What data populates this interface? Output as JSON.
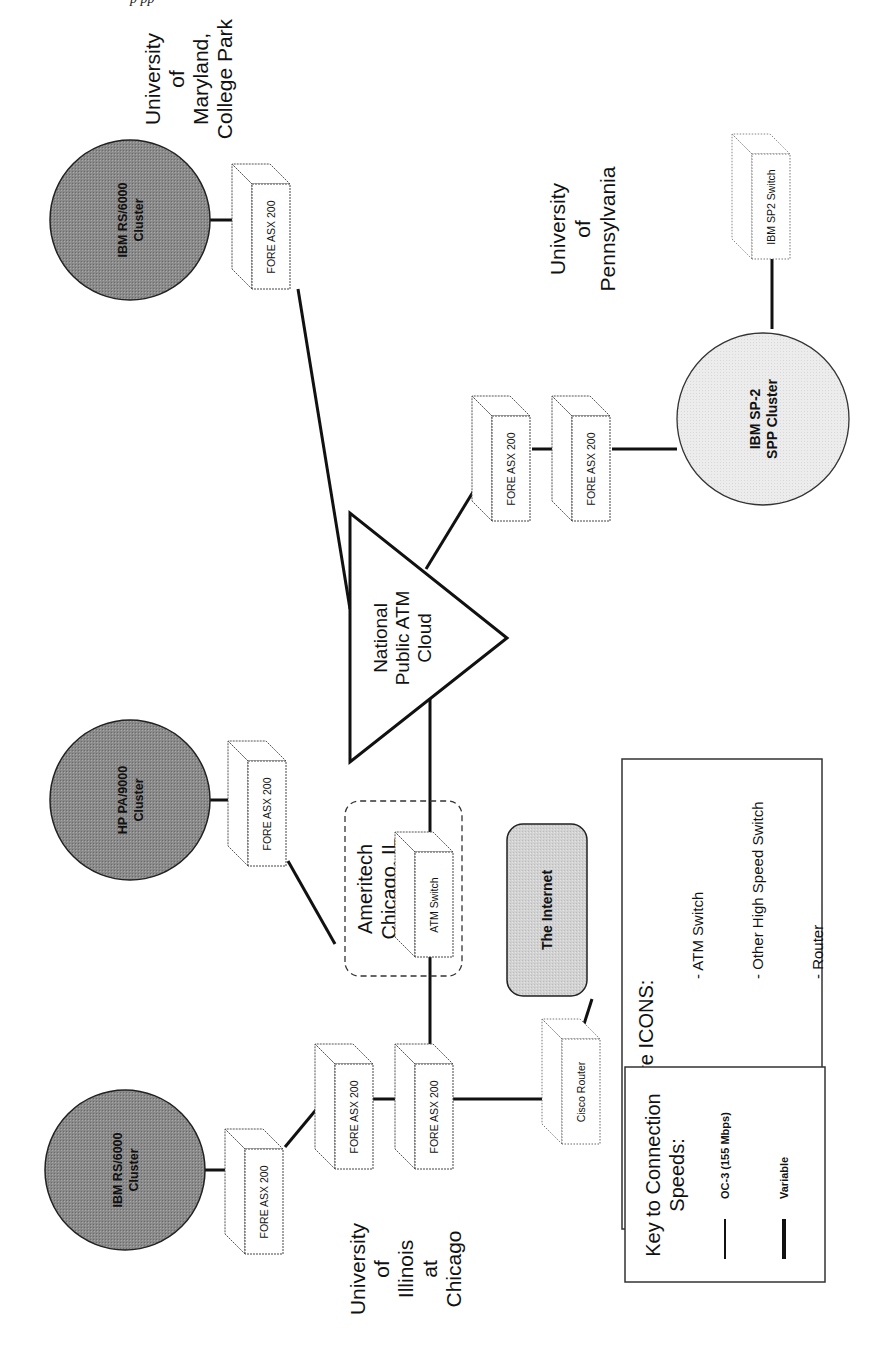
{
  "header": {
    "text_fragment": "p                      pp"
  },
  "sites": {
    "umd": [
      "University",
      "of",
      "Maryland,",
      "College Park"
    ],
    "upenn": [
      "University",
      "of",
      "Pennsylvania"
    ],
    "uic": [
      "University",
      "of",
      "Illinois",
      "at",
      "Chicago"
    ],
    "ameritech": [
      "Ameritech",
      "Chicago, IL"
    ]
  },
  "clusters": {
    "umd_cluster": [
      "IBM RS/6000",
      "Cluster"
    ],
    "hp_cluster": [
      "HP PA/9000",
      "Cluster"
    ],
    "uic_cluster": [
      "IBM RS/6000",
      "Cluster"
    ],
    "sp2_cluster": [
      "IBM SP-2",
      "SPP Cluster"
    ]
  },
  "cloud": [
    "National",
    "Public ATM",
    "Cloud"
  ],
  "internet": "The Internet",
  "devices": {
    "fore": "FORE ASX 200",
    "atm_switch": "ATM Switch",
    "cisco": "Cisco Router",
    "sp2_switch": "IBM SP2 Switch"
  },
  "hardware_key": {
    "title": "Key to Hardware ICONS:",
    "items": [
      {
        "label": "- ATM Switch",
        "color": "#2a2a2a"
      },
      {
        "label": "- Other High Speed Switch",
        "color": "#5a5a5a"
      },
      {
        "label": "- Router",
        "color": "#b8b8b8"
      }
    ]
  },
  "speed_key": {
    "title": [
      "Key to Connection",
      "Speeds:"
    ],
    "items": [
      {
        "label": "OC-3 (155 Mbps)",
        "width": 2
      },
      {
        "label": "Variable",
        "width": 4
      }
    ]
  },
  "colors": {
    "dark_cluster": "#8c8c8c",
    "light_cluster": "#e6e6e6",
    "internet_fill": "#d4d4d4",
    "line": "#111111"
  }
}
